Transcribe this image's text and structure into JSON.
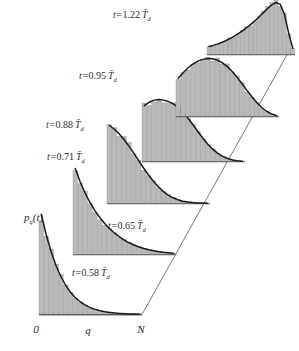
{
  "figure": {
    "title": "",
    "background_color": "#ffffff",
    "ink_color": "#2b2b2b",
    "bar_fill_color": "#b9b9b9",
    "bar_edge_color": "#8a8a8a",
    "curve_color": "#1a1a1a"
  },
  "axes": {
    "y_label": "p",
    "y_label_sub": "q",
    "y_label_tail": "(t)",
    "x_ticks": [
      "0",
      "q",
      "N"
    ]
  },
  "chart_data": {
    "type": "bar",
    "title": "",
    "xlabel": "q",
    "ylabel": "p_q(t)",
    "x_tick_labels": [
      "0",
      "q",
      "N"
    ],
    "grid": false,
    "legend": "none",
    "layout": "3d-waterfall-perspective",
    "xlim": [
      0,
      1
    ],
    "ylim": [
      0,
      1
    ],
    "panels": [
      {
        "label_prefix": "t=",
        "time_value": "0.58",
        "time_unit": "T",
        "time_unit_bar": true,
        "time_unit_sub": "d",
        "label": "t=0.58 T̄_d",
        "shape": "steep exponential decay",
        "categories": [
          0.0,
          0.05,
          0.1,
          0.15,
          0.2,
          0.25,
          0.3,
          0.35,
          0.4,
          0.45,
          0.5,
          0.55,
          0.6,
          0.65,
          0.7,
          0.75,
          0.8,
          0.85,
          0.9,
          0.95,
          1.0
        ],
        "values": [
          1.0,
          0.8,
          0.63,
          0.49,
          0.38,
          0.29,
          0.22,
          0.165,
          0.125,
          0.093,
          0.069,
          0.051,
          0.038,
          0.028,
          0.021,
          0.015,
          0.011,
          0.008,
          0.006,
          0.004,
          0.003
        ]
      },
      {
        "label_prefix": "t=",
        "time_value": "0.65",
        "time_unit": "T",
        "time_unit_bar": true,
        "time_unit_sub": "d",
        "label": "t=0.65 T̄_d",
        "shape": "exponential decay",
        "categories": [
          0.0,
          0.05,
          0.1,
          0.15,
          0.2,
          0.25,
          0.3,
          0.35,
          0.4,
          0.45,
          0.5,
          0.55,
          0.6,
          0.65,
          0.7,
          0.75,
          0.8,
          0.85,
          0.9,
          0.95,
          1.0
        ],
        "values": [
          1.0,
          0.845,
          0.715,
          0.605,
          0.51,
          0.43,
          0.36,
          0.3,
          0.25,
          0.205,
          0.168,
          0.136,
          0.11,
          0.088,
          0.07,
          0.055,
          0.043,
          0.033,
          0.025,
          0.019,
          0.014
        ]
      },
      {
        "label_prefix": "t=",
        "time_value": "0.71",
        "time_unit": "T",
        "time_unit_bar": true,
        "time_unit_sub": "d",
        "label": "t=0.71 T̄_d",
        "shape": "slow decay with shoulder",
        "categories": [
          0.0,
          0.05,
          0.1,
          0.15,
          0.2,
          0.25,
          0.3,
          0.35,
          0.4,
          0.45,
          0.5,
          0.55,
          0.6,
          0.65,
          0.7,
          0.75,
          0.8,
          0.85,
          0.9,
          0.95,
          1.0
        ],
        "values": [
          1.0,
          0.955,
          0.895,
          0.82,
          0.735,
          0.645,
          0.55,
          0.455,
          0.365,
          0.285,
          0.215,
          0.155,
          0.108,
          0.073,
          0.048,
          0.03,
          0.019,
          0.012,
          0.008,
          0.005,
          0.003
        ]
      },
      {
        "label_prefix": "t=",
        "time_value": "0.88",
        "time_unit": "T",
        "time_unit_bar": true,
        "time_unit_sub": "d",
        "label": "t=0.88 T̄_d",
        "shape": "flat top then sigmoid fall",
        "categories": [
          0.0,
          0.05,
          0.1,
          0.15,
          0.2,
          0.25,
          0.3,
          0.35,
          0.4,
          0.45,
          0.5,
          0.55,
          0.6,
          0.65,
          0.7,
          0.75,
          0.8,
          0.85,
          0.9,
          0.95,
          1.0
        ],
        "values": [
          0.9,
          0.955,
          0.99,
          1.0,
          0.99,
          0.965,
          0.925,
          0.865,
          0.785,
          0.69,
          0.585,
          0.475,
          0.37,
          0.275,
          0.195,
          0.13,
          0.082,
          0.048,
          0.026,
          0.013,
          0.006
        ]
      },
      {
        "label_prefix": "t=",
        "time_value": "0.95",
        "time_unit": "T",
        "time_unit_bar": true,
        "time_unit_sub": "d",
        "label": "t=0.95 T̄_d",
        "shape": "broad dome",
        "categories": [
          0.0,
          0.05,
          0.1,
          0.15,
          0.2,
          0.25,
          0.3,
          0.35,
          0.4,
          0.45,
          0.5,
          0.55,
          0.6,
          0.65,
          0.7,
          0.75,
          0.8,
          0.85,
          0.9,
          0.95,
          1.0
        ],
        "values": [
          0.66,
          0.755,
          0.84,
          0.905,
          0.955,
          0.985,
          1.0,
          0.995,
          0.97,
          0.925,
          0.86,
          0.775,
          0.675,
          0.565,
          0.45,
          0.34,
          0.24,
          0.155,
          0.09,
          0.045,
          0.018
        ]
      },
      {
        "label_prefix": "t=",
        "time_value": "1.22",
        "time_unit": "T",
        "time_unit_bar": true,
        "time_unit_sub": "d",
        "label": "t=1.22 T̄_d",
        "shape": "rising ramp with sharp peak near N",
        "categories": [
          0.0,
          0.05,
          0.1,
          0.15,
          0.2,
          0.25,
          0.3,
          0.35,
          0.4,
          0.45,
          0.5,
          0.55,
          0.6,
          0.65,
          0.7,
          0.75,
          0.8,
          0.85,
          0.9,
          0.95,
          1.0
        ],
        "values": [
          0.155,
          0.175,
          0.2,
          0.23,
          0.265,
          0.305,
          0.35,
          0.4,
          0.455,
          0.515,
          0.58,
          0.65,
          0.725,
          0.805,
          0.885,
          0.955,
          1.0,
          0.965,
          0.78,
          0.42,
          0.12
        ]
      }
    ]
  }
}
